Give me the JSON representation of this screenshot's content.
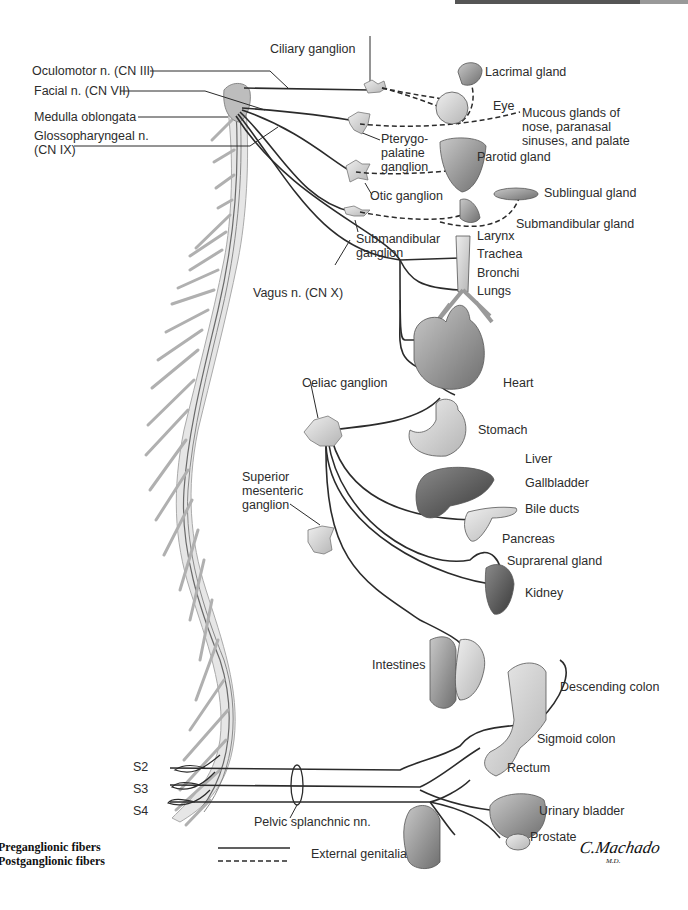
{
  "diagram": {
    "type": "anatomical illustration",
    "colors": {
      "nerve_line": "#2b2b2b",
      "organ_gray": "#9a9a9a",
      "spinal_cord": "#d8d8d8",
      "background": "#ffffff"
    }
  },
  "labels": {
    "cranial": {
      "oculomotor": "Oculomotor n. (CN III)",
      "facial": "Facial n. (CN VII)",
      "medulla": "Medulla oblongata",
      "glossopharyngeal": "Glossopharyngeal n.\n(CN IX)",
      "vagus": "Vagus n. (CN X)"
    },
    "ganglia": {
      "ciliary": "Ciliary ganglion",
      "pterygopalatine": "Pterygo-\npalatine\nganglion",
      "otic": "Otic ganglion",
      "submandibular": "Submandibular\nganglion",
      "celiac": "Celiac ganglion",
      "superior_mesenteric": "Superior\nmesenteric\nganglion"
    },
    "organs": {
      "lacrimal": "Lacrimal gland",
      "eye": "Eye",
      "mucous": "Mucous glands of\nnose, paranasal\nsinuses, and palate",
      "parotid": "Parotid gland",
      "sublingual": "Sublingual gland",
      "submandibular_gland": "Submandibular gland",
      "larynx": "Larynx",
      "trachea": "Trachea",
      "bronchi": "Bronchi",
      "lungs": "Lungs",
      "heart": "Heart",
      "stomach": "Stomach",
      "liver": "Liver",
      "gallbladder": "Gallbladder",
      "bile_ducts": "Bile ducts",
      "pancreas": "Pancreas",
      "suprarenal": "Suprarenal gland",
      "kidney": "Kidney",
      "intestines": "Intestines",
      "descending_colon": "Descending colon",
      "sigmoid_colon": "Sigmoid colon",
      "rectum": "Rectum",
      "urinary_bladder": "Urinary bladder",
      "prostate": "Prostate",
      "external_genitalia": "External genitalia"
    },
    "sacral": {
      "s2": "S2",
      "s3": "S3",
      "s4": "S4",
      "pelvic_splanchnic": "Pelvic splanchnic nn."
    }
  },
  "legend": {
    "preganglionic": "Preganglionic fibers",
    "postganglionic": "Postganglionic fibers"
  },
  "signature": {
    "name": "C.Machado",
    "suffix": "M.D."
  }
}
